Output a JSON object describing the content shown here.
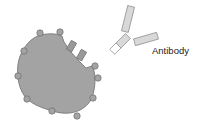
{
  "diagram": {
    "type": "biology-illustration",
    "labels": {
      "antibody": "Antibody"
    },
    "colors": {
      "cell_fill": "#a3a3a3",
      "cell_stroke": "#6e6e6e",
      "knob_fill": "#a3a3a3",
      "receptor_fill": "#999999",
      "antibody_fill": "#d8d8d8",
      "antibody_stroke": "#8a8a8a",
      "text": "#222222"
    },
    "elements": [
      {
        "id": "cell",
        "kind": "cell-body"
      },
      {
        "id": "surface-knobs",
        "kind": "surface-proteins",
        "count": 10
      },
      {
        "id": "receptors",
        "kind": "receptor",
        "count": 2
      },
      {
        "id": "antibody",
        "kind": "antibody",
        "label": "Antibody"
      }
    ]
  }
}
